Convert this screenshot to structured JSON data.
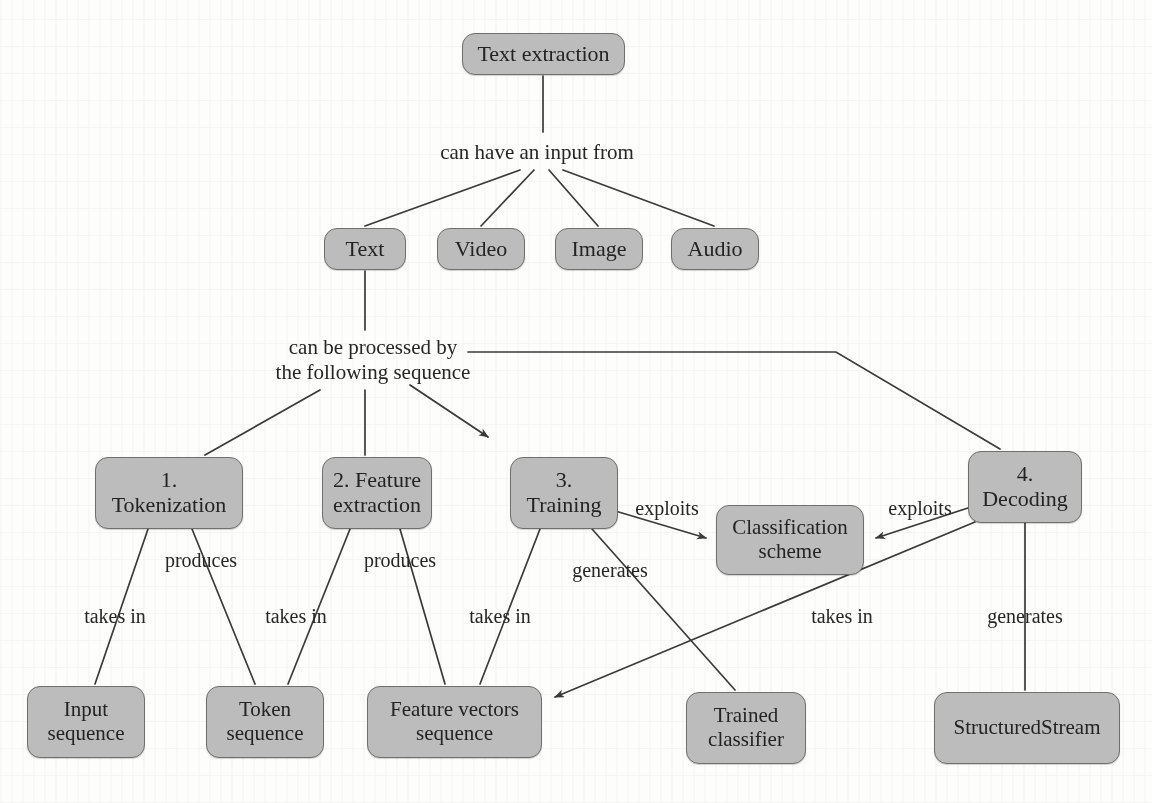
{
  "diagram": {
    "style": {
      "node_fill": "#bcbcbc",
      "node_border": "#6f6f6f",
      "edge_color": "#3a3a3a",
      "page_background": "#fdfdfc",
      "text_color": "#232323"
    },
    "nodes": [
      {
        "id": "text-extraction",
        "label": "Text extraction",
        "x": 462,
        "y": 33,
        "w": 163,
        "h": 42,
        "font_size": 22
      },
      {
        "id": "text",
        "label": "Text",
        "x": 324,
        "y": 228,
        "w": 82,
        "h": 42,
        "font_size": 22
      },
      {
        "id": "video",
        "label": "Video",
        "x": 437,
        "y": 228,
        "w": 88,
        "h": 42,
        "font_size": 22
      },
      {
        "id": "image",
        "label": "Image",
        "x": 555,
        "y": 228,
        "w": 88,
        "h": 42,
        "font_size": 22
      },
      {
        "id": "audio",
        "label": "Audio",
        "x": 671,
        "y": 228,
        "w": 88,
        "h": 42,
        "font_size": 22
      },
      {
        "id": "tokenization",
        "label": "1.\nTokenization",
        "x": 95,
        "y": 457,
        "w": 148,
        "h": 72,
        "font_size": 22
      },
      {
        "id": "feature-extraction",
        "label": "2. Feature\nextraction",
        "x": 322,
        "y": 457,
        "w": 110,
        "h": 72,
        "font_size": 22
      },
      {
        "id": "training",
        "label": "3.\nTraining",
        "x": 510,
        "y": 457,
        "w": 108,
        "h": 72,
        "font_size": 22
      },
      {
        "id": "decoding",
        "label": "4.\nDecoding",
        "x": 968,
        "y": 451,
        "w": 114,
        "h": 72,
        "font_size": 22
      },
      {
        "id": "classification-scheme",
        "label": "Classification\nscheme",
        "x": 716,
        "y": 505,
        "w": 148,
        "h": 70,
        "font_size": 21
      },
      {
        "id": "input-sequence",
        "label": "Input\nsequence",
        "x": 27,
        "y": 686,
        "w": 118,
        "h": 72,
        "font_size": 21
      },
      {
        "id": "token-sequence",
        "label": "Token\nsequence",
        "x": 206,
        "y": 686,
        "w": 118,
        "h": 72,
        "font_size": 21
      },
      {
        "id": "feature-vectors-sequence",
        "label": "Feature vectors\nsequence",
        "x": 367,
        "y": 686,
        "w": 175,
        "h": 72,
        "font_size": 21
      },
      {
        "id": "trained-classifier",
        "label": "Trained\nclassifier",
        "x": 686,
        "y": 692,
        "w": 120,
        "h": 72,
        "font_size": 21
      },
      {
        "id": "structured-stream",
        "label": "StructuredStream",
        "x": 934,
        "y": 692,
        "w": 186,
        "h": 72,
        "font_size": 21
      }
    ],
    "edge_labels": [
      {
        "id": "can-have-an-input-from",
        "text": "can have an input from",
        "x": 422,
        "y": 140,
        "w": 230,
        "font_size": 21
      },
      {
        "id": "can-be-processed-by",
        "text": "can be processed by\nthe following sequence",
        "x": 258,
        "y": 335,
        "w": 230,
        "font_size": 21
      },
      {
        "id": "takes-in-tokenization",
        "text": "takes in",
        "x": 73,
        "y": 604,
        "w": 84,
        "font_size": 20
      },
      {
        "id": "produces-tokenization",
        "text": "produces",
        "x": 151,
        "y": 548,
        "w": 100,
        "font_size": 20
      },
      {
        "id": "takes-in-feature",
        "text": "takes in",
        "x": 254,
        "y": 604,
        "w": 84,
        "font_size": 20
      },
      {
        "id": "produces-feature",
        "text": "produces",
        "x": 350,
        "y": 548,
        "w": 100,
        "font_size": 20
      },
      {
        "id": "takes-in-training",
        "text": "takes in",
        "x": 458,
        "y": 604,
        "w": 84,
        "font_size": 20
      },
      {
        "id": "generates-training",
        "text": "generates",
        "x": 558,
        "y": 558,
        "w": 104,
        "font_size": 20
      },
      {
        "id": "exploits-training",
        "text": "exploits",
        "x": 625,
        "y": 496,
        "w": 84,
        "font_size": 20
      },
      {
        "id": "exploits-decoding",
        "text": "exploits",
        "x": 878,
        "y": 496,
        "w": 84,
        "font_size": 20
      },
      {
        "id": "takes-in-decoding",
        "text": "takes in",
        "x": 800,
        "y": 604,
        "w": 84,
        "font_size": 20
      },
      {
        "id": "generates-decoding",
        "text": "generates",
        "x": 973,
        "y": 604,
        "w": 104,
        "font_size": 20
      }
    ],
    "relations": [
      {
        "from": "text-extraction",
        "to": "text",
        "label": "can have an input from"
      },
      {
        "from": "text-extraction",
        "to": "video",
        "label": "can have an input from"
      },
      {
        "from": "text-extraction",
        "to": "image",
        "label": "can have an input from"
      },
      {
        "from": "text-extraction",
        "to": "audio",
        "label": "can have an input from"
      },
      {
        "from": "text",
        "to": "tokenization",
        "label": "can be processed by the following sequence"
      },
      {
        "from": "text",
        "to": "feature-extraction",
        "label": "can be processed by the following sequence"
      },
      {
        "from": "text",
        "to": "training",
        "label": "can be processed by the following sequence",
        "arrow": true
      },
      {
        "from": "text",
        "to": "decoding",
        "label": "can be processed by the following sequence"
      },
      {
        "from": "tokenization",
        "to": "input-sequence",
        "label": "takes in"
      },
      {
        "from": "tokenization",
        "to": "token-sequence",
        "label": "produces"
      },
      {
        "from": "feature-extraction",
        "to": "token-sequence",
        "label": "takes in"
      },
      {
        "from": "feature-extraction",
        "to": "feature-vectors-sequence",
        "label": "produces"
      },
      {
        "from": "training",
        "to": "feature-vectors-sequence",
        "label": "takes in"
      },
      {
        "from": "training",
        "to": "trained-classifier",
        "label": "generates"
      },
      {
        "from": "training",
        "to": "classification-scheme",
        "label": "exploits",
        "arrow": true
      },
      {
        "from": "decoding",
        "to": "classification-scheme",
        "label": "exploits",
        "arrow": true
      },
      {
        "from": "decoding",
        "to": "feature-vectors-sequence",
        "label": "takes in",
        "arrow": true
      },
      {
        "from": "decoding",
        "to": "structured-stream",
        "label": "generates"
      }
    ]
  }
}
